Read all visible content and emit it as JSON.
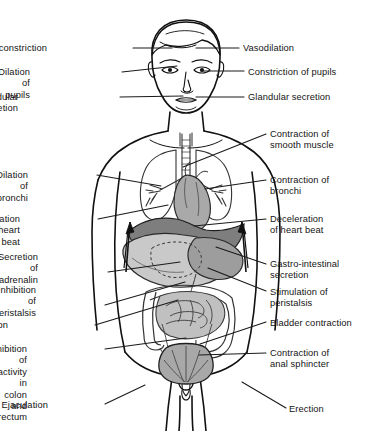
{
  "figure": {
    "colors": {
      "outline": "#111111",
      "background": "#ffffff",
      "heart": "#a9a9a9",
      "diaphragm": "#808080",
      "liver": "#c9c9c9",
      "stomach": "#b5b5b5",
      "intestine": "#bfbfbf",
      "bladder": "#a8a8a8",
      "leader_line": "#1a1a1a"
    }
  },
  "labels_left": [
    {
      "id": "vasoconstriction-head",
      "text": "Vasoconstriction",
      "x": 47,
      "y": 43,
      "line_from_x": 133,
      "line_from_y": 48,
      "line_to_x": 172,
      "line_to_y": 48
    },
    {
      "id": "dilation-of-pupils",
      "text": "Dilation of pupils",
      "x": 30,
      "y": 67,
      "line_from_x": 122,
      "line_from_y": 72,
      "line_to_x": 177,
      "line_to_y": 66
    },
    {
      "id": "glandular-secretion-left",
      "text": "Glandular secretion",
      "x": 18,
      "y": 92,
      "line_from_x": 120,
      "line_from_y": 97,
      "line_to_x": 183,
      "line_to_y": 96
    },
    {
      "id": "dilation-of-bronchi",
      "text": "Dilation of\nbronchi",
      "x": 28,
      "y": 170,
      "line_from_x": 97,
      "line_from_y": 175,
      "line_to_x": 161,
      "line_to_y": 186
    },
    {
      "id": "acceleration-of-heart-beat",
      "text": "Acceleration\nof heart\nbeat",
      "x": 20,
      "y": 214,
      "line_from_x": 98,
      "line_from_y": 219,
      "line_to_x": 168,
      "line_to_y": 205
    },
    {
      "id": "secretion-of-adrenalin",
      "text": "Secretion of\nadrenalin",
      "x": 38,
      "y": 252,
      "line_from_x": 108,
      "line_from_y": 272,
      "line_to_x": 180,
      "line_to_y": 262
    },
    {
      "id": "inhibition-of-peristalsis",
      "text": "Inhibition of\nperistalsis",
      "x": 36,
      "y": 285,
      "line_from_x": 105,
      "line_from_y": 305,
      "line_to_x": 185,
      "line_to_y": 282
    },
    {
      "id": "vasoconstriction-body",
      "text": "Vasoconstriction",
      "x": 8,
      "y": 320,
      "line_from_x": 95,
      "line_from_y": 325,
      "line_to_x": 178,
      "line_to_y": 300
    },
    {
      "id": "inhibition-of-colon-rectum",
      "text": "Inhibition of\nactivity in\ncolon and\nrectum",
      "x": 27,
      "y": 344,
      "line_from_x": 105,
      "line_from_y": 349,
      "line_to_x": 186,
      "line_to_y": 338
    },
    {
      "id": "ejaculation",
      "text": "Ejaculation",
      "x": 48,
      "y": 400,
      "line_from_x": 105,
      "line_from_y": 404,
      "line_to_x": 145,
      "line_to_y": 385
    }
  ],
  "labels_right": [
    {
      "id": "vasodilation",
      "text": "Vasodilation",
      "x": 243,
      "y": 43,
      "line_from_x": 196,
      "line_from_y": 48,
      "line_to_x": 239,
      "line_to_y": 48
    },
    {
      "id": "constriction-of-pupils",
      "text": "Constriction of pupils",
      "x": 248,
      "y": 67,
      "line_from_x": 201,
      "line_from_y": 71,
      "line_to_x": 244,
      "line_to_y": 71
    },
    {
      "id": "glandular-secretion-right",
      "text": "Glandular secretion",
      "x": 248,
      "y": 92,
      "line_from_x": 196,
      "line_from_y": 97,
      "line_to_x": 244,
      "line_to_y": 97
    },
    {
      "id": "contraction-of-smooth-muscle",
      "text": "Contraction of\nsmooth muscle",
      "x": 270,
      "y": 129,
      "line_from_x": 183,
      "line_from_y": 167,
      "line_to_x": 266,
      "line_to_y": 134
    },
    {
      "id": "contraction-of-bronchi",
      "text": "Contraction of\nbronchi",
      "x": 270,
      "y": 175,
      "line_from_x": 205,
      "line_from_y": 189,
      "line_to_x": 266,
      "line_to_y": 180
    },
    {
      "id": "deceleration-of-heart-beat",
      "text": "Deceleration\nof heart beat",
      "x": 270,
      "y": 214,
      "line_from_x": 194,
      "line_from_y": 226,
      "line_to_x": 266,
      "line_to_y": 219
    },
    {
      "id": "gastro-intestinal-secretion",
      "text": "Gastro-intestinal\nsecretion",
      "x": 270,
      "y": 259,
      "line_from_x": 216,
      "line_from_y": 247,
      "line_to_x": 266,
      "line_to_y": 264
    },
    {
      "id": "stimulation-of-peristalsis",
      "text": "Stimulation of\nperistalsis",
      "x": 270,
      "y": 287,
      "line_from_x": 208,
      "line_from_y": 268,
      "line_to_x": 266,
      "line_to_y": 291
    },
    {
      "id": "bladder-contraction",
      "text": "Bladder contraction",
      "x": 270,
      "y": 318,
      "line_from_x": 200,
      "line_from_y": 344,
      "line_to_x": 266,
      "line_to_y": 322
    },
    {
      "id": "contraction-of-anal-sphincter",
      "text": "Contraction of\nanal sphincter",
      "x": 270,
      "y": 348,
      "line_from_x": 199,
      "line_from_y": 355,
      "line_to_x": 266,
      "line_to_y": 353
    },
    {
      "id": "erection",
      "text": "Erection",
      "x": 289,
      "y": 404,
      "line_from_x": 242,
      "line_from_y": 382,
      "line_to_x": 286,
      "line_to_y": 408
    }
  ]
}
